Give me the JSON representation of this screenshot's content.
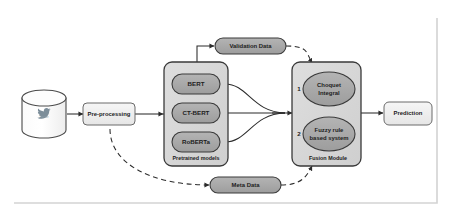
{
  "diagram": {
    "colors": {
      "node_gray_fill": "#a8a8a8",
      "node_light_fill": "#f0f0f0",
      "container_fill": "#d8d8d8",
      "stroke": "#2b2b2b",
      "frame": "#d3d3d3",
      "twitter_blue": "#7e8e99"
    },
    "source": {
      "name": "twitter-database-cylinder",
      "icon": "twitter-bird-icon",
      "caption": "Twitter"
    },
    "preprocessing": {
      "label": "Pre-processing"
    },
    "pretrained_container": {
      "label": "Pretrained models",
      "models": [
        {
          "label": "BERT"
        },
        {
          "label": "CT-BERT"
        },
        {
          "label": "RoBERTa"
        }
      ]
    },
    "fusion_container": {
      "label": "Fusion Module",
      "methods": [
        {
          "index": "1",
          "label_line1": "Choquet",
          "label_line2": "Integral"
        },
        {
          "index": "2",
          "label_line1": "Fuzzy rule",
          "label_line2": "based system"
        }
      ]
    },
    "validation_data": {
      "label": "Validation Data"
    },
    "meta_data": {
      "label": "Meta Data"
    },
    "prediction": {
      "label": "Prediction"
    }
  }
}
